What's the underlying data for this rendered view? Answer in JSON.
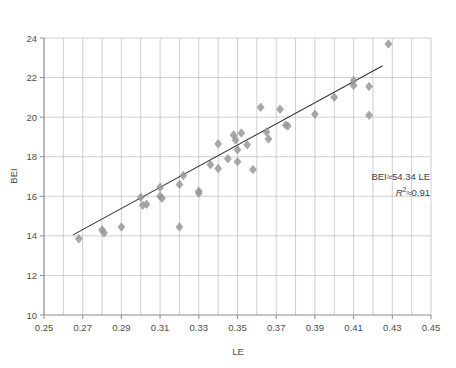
{
  "chart_data": {
    "type": "scatter",
    "title": "",
    "xlabel": "LE",
    "ylabel": "BEI",
    "xlim": [
      0.25,
      0.45
    ],
    "ylim": [
      10,
      24
    ],
    "xticks": [
      0.25,
      0.27,
      0.29,
      0.31,
      0.33,
      0.35,
      0.37,
      0.39,
      0.41,
      0.43,
      0.45
    ],
    "xtick_labels": [
      "0.25",
      "0.27",
      "0.29",
      "0.31",
      "0.33",
      "0.35",
      "0.37",
      "0.39",
      "0.41",
      "0.43",
      "0.45"
    ],
    "yticks": [
      10,
      12,
      14,
      16,
      18,
      20,
      22,
      24
    ],
    "ytick_labels": [
      "10",
      "12",
      "14",
      "16",
      "18",
      "20",
      "22",
      "24"
    ],
    "xgrid_minor_step": 0.01,
    "grid": true,
    "legend": "none",
    "marker": {
      "shape": "diamond",
      "color": "#999999",
      "size": 7
    },
    "points": [
      {
        "x": 0.268,
        "y": 13.85
      },
      {
        "x": 0.28,
        "y": 14.3
      },
      {
        "x": 0.281,
        "y": 14.15
      },
      {
        "x": 0.29,
        "y": 14.45
      },
      {
        "x": 0.3,
        "y": 15.95
      },
      {
        "x": 0.301,
        "y": 15.55
      },
      {
        "x": 0.303,
        "y": 15.6
      },
      {
        "x": 0.31,
        "y": 16.45
      },
      {
        "x": 0.31,
        "y": 16.0
      },
      {
        "x": 0.311,
        "y": 15.9
      },
      {
        "x": 0.32,
        "y": 16.6
      },
      {
        "x": 0.32,
        "y": 14.45
      },
      {
        "x": 0.322,
        "y": 17.05
      },
      {
        "x": 0.33,
        "y": 16.25
      },
      {
        "x": 0.33,
        "y": 16.15
      },
      {
        "x": 0.336,
        "y": 17.6
      },
      {
        "x": 0.34,
        "y": 18.65
      },
      {
        "x": 0.34,
        "y": 17.4
      },
      {
        "x": 0.345,
        "y": 17.9
      },
      {
        "x": 0.348,
        "y": 19.1
      },
      {
        "x": 0.349,
        "y": 18.85
      },
      {
        "x": 0.35,
        "y": 18.35
      },
      {
        "x": 0.35,
        "y": 17.75
      },
      {
        "x": 0.352,
        "y": 19.2
      },
      {
        "x": 0.355,
        "y": 18.6
      },
      {
        "x": 0.358,
        "y": 17.35
      },
      {
        "x": 0.362,
        "y": 20.5
      },
      {
        "x": 0.365,
        "y": 19.25
      },
      {
        "x": 0.366,
        "y": 18.9
      },
      {
        "x": 0.372,
        "y": 20.4
      },
      {
        "x": 0.375,
        "y": 19.6
      },
      {
        "x": 0.376,
        "y": 19.55
      },
      {
        "x": 0.39,
        "y": 20.15
      },
      {
        "x": 0.4,
        "y": 21.0
      },
      {
        "x": 0.41,
        "y": 21.85
      },
      {
        "x": 0.41,
        "y": 21.6
      },
      {
        "x": 0.418,
        "y": 21.55
      },
      {
        "x": 0.418,
        "y": 20.1
      },
      {
        "x": 0.428,
        "y": 23.7
      }
    ],
    "trendline": {
      "visible": true,
      "color": "#333333",
      "x_start": 0.265,
      "x_end": 0.425,
      "y_start": 14.05,
      "y_end": 22.6
    },
    "annotations": [
      {
        "name": "equation",
        "text": "BEI≈54.34 LE"
      },
      {
        "name": "r-squared",
        "text_prefix": "R",
        "text_sup": "2",
        "text_suffix": "≈0.91"
      }
    ]
  },
  "colors": {
    "marker": "#999999",
    "trendline": "#333333",
    "grid": "#b9b9c4",
    "axis": "#8a8a8a",
    "text": "#4d4d4d",
    "background": "#ffffff"
  }
}
